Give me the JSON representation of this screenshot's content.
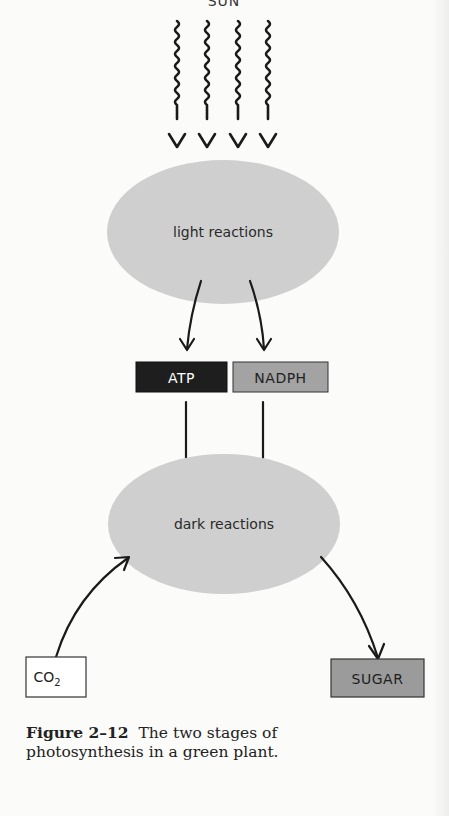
{
  "figure": {
    "source_label": "SUN",
    "stages": {
      "light": "light reactions",
      "dark": "dark reactions"
    },
    "intermediates": {
      "atp": "ATP",
      "nadph": "NADPH"
    },
    "input": "CO",
    "input_subscript": "2",
    "output": "SUGAR",
    "colors": {
      "ellipse": "#cfcfcf",
      "atp_box": "#1e1e1e",
      "nadph_box": "#a3a3a3",
      "sugar_box": "#9b9b9b",
      "co2_box": "#ffffff",
      "ink": "#1a1a1a"
    },
    "arrows": [
      {
        "from": "SUN",
        "to": "light reactions",
        "count": 4,
        "style": "wavy"
      },
      {
        "from": "light reactions",
        "to": "ATP"
      },
      {
        "from": "light reactions",
        "to": "NADPH"
      },
      {
        "from": "ATP",
        "to": "dark reactions"
      },
      {
        "from": "NADPH",
        "to": "dark reactions"
      },
      {
        "from": "CO2",
        "to": "dark reactions"
      },
      {
        "from": "dark reactions",
        "to": "SUGAR"
      }
    ]
  },
  "caption": {
    "label": "Figure 2–12",
    "text": "The two stages of photosynthesis in a green plant."
  }
}
